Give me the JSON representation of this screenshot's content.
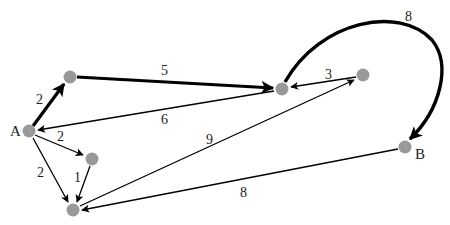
{
  "graph": {
    "type": "weighted-directed-graph",
    "node_color": "#999999",
    "edge_color": "#000000",
    "nodes": [
      {
        "id": "A",
        "label": "A",
        "x": 29,
        "y": 131
      },
      {
        "id": "n1",
        "label": "",
        "x": 70,
        "y": 77
      },
      {
        "id": "n2",
        "label": "",
        "x": 282,
        "y": 89
      },
      {
        "id": "n3",
        "label": "",
        "x": 363,
        "y": 75
      },
      {
        "id": "n4",
        "label": "",
        "x": 92,
        "y": 159
      },
      {
        "id": "n5",
        "label": "",
        "x": 73,
        "y": 210
      },
      {
        "id": "B",
        "label": "B",
        "x": 405,
        "y": 147
      }
    ],
    "edges": [
      {
        "from": "A",
        "to": "n1",
        "weight": "2",
        "bold": true
      },
      {
        "from": "n1",
        "to": "n2",
        "weight": "5",
        "bold": true
      },
      {
        "from": "n2",
        "to": "A",
        "weight": "6",
        "bold": false
      },
      {
        "from": "n3",
        "to": "n2",
        "weight": "3",
        "bold": false
      },
      {
        "from": "n2",
        "to": "B",
        "weight": "8",
        "bold": true,
        "curved": true
      },
      {
        "from": "A",
        "to": "n4",
        "weight": "2",
        "bold": false
      },
      {
        "from": "A",
        "to": "n5",
        "weight": "2",
        "bold": false
      },
      {
        "from": "n4",
        "to": "n5",
        "weight": "1",
        "bold": false
      },
      {
        "from": "n5",
        "to": "n3",
        "weight": "9",
        "bold": false
      },
      {
        "from": "B",
        "to": "n5",
        "weight": "8",
        "bold": false
      }
    ]
  },
  "labels": {
    "node_A": "A",
    "node_B": "B",
    "w_A_n1": "2",
    "w_n1_n2": "5",
    "w_n2_A": "6",
    "w_n3_n2": "3",
    "w_n2_B": "8",
    "w_A_n4": "2",
    "w_A_n5": "2",
    "w_n4_n5": "1",
    "w_n5_n3": "9",
    "w_B_n5": "8"
  }
}
